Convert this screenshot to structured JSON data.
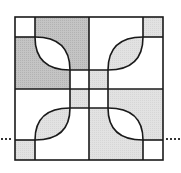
{
  "figure": {
    "title": "Quilt block pattern",
    "colors": {
      "dark_gray": "#bdbdbd",
      "light_gray": "#e4e4e4",
      "white": "#ffffff",
      "stroke": "#1a1a1a",
      "dots": "#333333"
    },
    "frame": {
      "x1": 15,
      "y1": 17,
      "x2": 163,
      "y2": 160
    },
    "center": {
      "x": 89,
      "y": 89
    },
    "quadrants": [
      {
        "name": "top-left",
        "fill": "dark_gray",
        "corner_square": "white",
        "leaf": "white",
        "center_square": "white"
      },
      {
        "name": "top-right",
        "fill": "white",
        "corner_square": "light_gray",
        "leaf": "light_gray",
        "center_square": "light_gray"
      },
      {
        "name": "bottom-left",
        "fill": "white",
        "corner_square": "light_gray",
        "leaf": "light_gray",
        "center_square": "light_gray"
      },
      {
        "name": "bottom-right",
        "fill": "light_gray",
        "corner_square": "white",
        "leaf": "white",
        "center_square": "white"
      }
    ],
    "dotted_extensions": {
      "y": 139,
      "left": [
        0,
        14
      ],
      "right": [
        165,
        181
      ]
    }
  }
}
